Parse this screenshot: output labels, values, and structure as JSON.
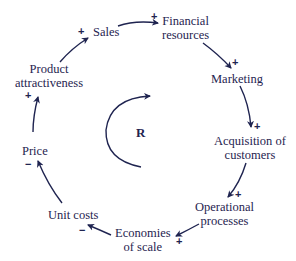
{
  "diagram": {
    "type": "causal-loop",
    "loop_label": "R",
    "color": "#1f2450",
    "nodes": [
      {
        "id": "sales",
        "label": "Sales"
      },
      {
        "id": "financial",
        "label_line1": "Financial",
        "label_line2": "resources"
      },
      {
        "id": "marketing",
        "label": "Marketing"
      },
      {
        "id": "acquisition",
        "label_line1": "Acquisition of",
        "label_line2": "customers"
      },
      {
        "id": "operational",
        "label_line1": "Operational",
        "label_line2": "processes"
      },
      {
        "id": "economies",
        "label_line1": "Economies",
        "label_line2": "of scale"
      },
      {
        "id": "unitcosts",
        "label": "Unit costs"
      },
      {
        "id": "price",
        "label": "Price"
      },
      {
        "id": "attractiveness",
        "label_line1": "Product",
        "label_line2": "attractiveness"
      }
    ],
    "links": [
      {
        "from": "sales",
        "to": "financial",
        "sign": "+"
      },
      {
        "from": "financial",
        "to": "marketing",
        "sign": "+"
      },
      {
        "from": "marketing",
        "to": "acquisition",
        "sign": "+"
      },
      {
        "from": "acquisition",
        "to": "operational",
        "sign": "+"
      },
      {
        "from": "operational",
        "to": "economies",
        "sign": "+"
      },
      {
        "from": "economies",
        "to": "unitcosts",
        "sign": "−"
      },
      {
        "from": "unitcosts",
        "to": "price",
        "sign": "−"
      },
      {
        "from": "price",
        "to": "attractiveness",
        "sign": "+"
      },
      {
        "from": "attractiveness",
        "to": "sales",
        "sign": "+"
      }
    ]
  }
}
